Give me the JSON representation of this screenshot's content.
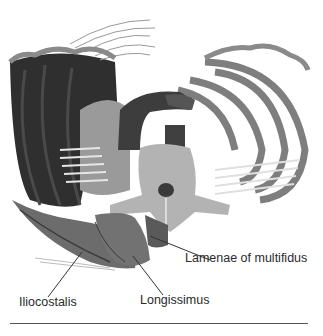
{
  "figure": {
    "colors": {
      "background": "#ffffff",
      "dark_cavity": "#2e2e2e",
      "muscle": "#6e6e6e",
      "rib": "#8a8a8a",
      "bone": "#b4b4b4",
      "line": "#333333"
    },
    "labels": [
      {
        "id": "iliocostalis",
        "text": "Iliocostalis",
        "x": 19,
        "y": 303,
        "leader": [
          [
            48,
            297
          ],
          [
            82,
            252
          ]
        ]
      },
      {
        "id": "longissimus",
        "text": "Longissimus",
        "x": 140,
        "y": 301,
        "leader": [
          [
            163,
            295
          ],
          [
            133,
            256
          ]
        ]
      },
      {
        "id": "lamenae-of-multifidus",
        "text": "Lamenae of multifidus",
        "x": 185,
        "y": 260,
        "leader": [
          [
            210,
            260
          ],
          [
            150,
            236
          ]
        ]
      }
    ]
  }
}
